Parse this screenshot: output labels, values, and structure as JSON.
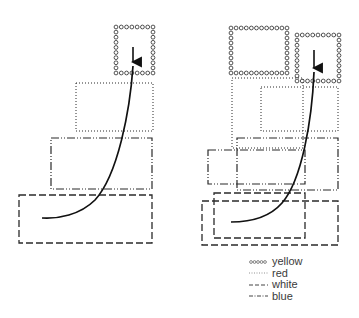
{
  "diagram": {
    "left_panel": {
      "boxes": [
        {
          "type": "yellow",
          "x": 116,
          "y": 27,
          "w": 37,
          "h": 46
        },
        {
          "type": "red",
          "x": 76,
          "y": 83,
          "w": 77,
          "h": 48
        },
        {
          "type": "blue",
          "x": 51,
          "y": 138,
          "w": 101,
          "h": 51
        },
        {
          "type": "white",
          "x": 19,
          "y": 195,
          "w": 133,
          "h": 48
        }
      ],
      "trajectory": {
        "start": [
          133,
          47
        ],
        "arrow_at": [
          133,
          66
        ],
        "end": [
          42,
          218
        ]
      }
    },
    "right_panel": {
      "boxes": [
        {
          "type": "yellow",
          "x": 231,
          "y": 28,
          "w": 56,
          "h": 45
        },
        {
          "type": "yellow",
          "x": 297,
          "y": 35,
          "w": 42,
          "h": 46
        },
        {
          "type": "red",
          "x": 232,
          "y": 78,
          "w": 71,
          "h": 70
        },
        {
          "type": "red",
          "x": 261,
          "y": 87,
          "w": 77,
          "h": 44
        },
        {
          "type": "blue",
          "x": 237,
          "y": 138,
          "w": 101,
          "h": 52
        },
        {
          "type": "blue",
          "x": 208,
          "y": 150,
          "w": 97,
          "h": 34
        },
        {
          "type": "white",
          "x": 214,
          "y": 193,
          "w": 91,
          "h": 45
        },
        {
          "type": "white",
          "x": 202,
          "y": 201,
          "w": 136,
          "h": 44
        }
      ],
      "trajectory": {
        "start": [
          314,
          50
        ],
        "arrow_at": [
          314,
          72
        ],
        "end": [
          231,
          222
        ]
      }
    },
    "legend": [
      {
        "key": "yellow",
        "label": "yellow",
        "style": "circles"
      },
      {
        "key": "red",
        "label": "red",
        "style": "dotted"
      },
      {
        "key": "white",
        "label": "white",
        "style": "dashed"
      },
      {
        "key": "blue",
        "label": "blue",
        "style": "dash-dot"
      }
    ],
    "colors": {
      "stroke": "#2a2a2a",
      "text": "#3a3a3a",
      "background": "#ffffff"
    }
  }
}
